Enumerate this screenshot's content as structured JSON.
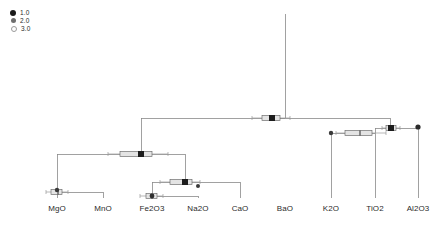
{
  "legend": {
    "name": "size-legend",
    "items": [
      {
        "label": "1.0",
        "marker": "filled-circle",
        "color": "#1a1a1a",
        "size": 6
      },
      {
        "label": "2.0",
        "marker": "medium-circle",
        "color": "#6e6e6e",
        "size": 5
      },
      {
        "label": "3.0",
        "marker": "open-circle",
        "color": "#b4b4b4",
        "size": 4
      }
    ]
  },
  "axis": {
    "leaf_labels": [
      "MgO",
      "MnO",
      "Fe2O3",
      "Na2O",
      "CaO",
      "BaO",
      "K2O",
      "TiO2",
      "Al2O3"
    ]
  },
  "chart_data": {
    "type": "tree",
    "title": "",
    "xlabel": "",
    "ylabel": "",
    "grid": false,
    "legend_position": "top-left",
    "leaves": [
      {
        "label": "MgO",
        "x": 57
      },
      {
        "label": "MnO",
        "x": 103
      },
      {
        "label": "Fe2O3",
        "x": 152
      },
      {
        "label": "Na2O",
        "x": 198
      },
      {
        "label": "CaO",
        "x": 240
      },
      {
        "label": "BaO",
        "x": 285
      },
      {
        "label": "K2O",
        "x": 331
      },
      {
        "label": "TiO2",
        "x": 375
      },
      {
        "label": "Al2O3",
        "x": 418
      }
    ],
    "nodes": [
      {
        "id": "n1",
        "children": [
          "MgO",
          "MnO"
        ],
        "x": 57,
        "y": 192,
        "box": {
          "q1": 51,
          "med": 58,
          "q3": 62,
          "lo": 46,
          "hi": 68
        }
      },
      {
        "id": "n2",
        "children": [
          "Fe2O3",
          "Na2O"
        ],
        "x": 152,
        "y": 196,
        "box": {
          "q1": 146,
          "med": 152,
          "q3": 157,
          "lo": 140,
          "hi": 163
        }
      },
      {
        "id": "n3",
        "children": [
          "n2",
          "CaO"
        ],
        "x": 185,
        "y": 182,
        "box": {
          "q1": 170,
          "med": 185,
          "q3": 192,
          "lo": 160,
          "hi": 200
        }
      },
      {
        "id": "n4",
        "children": [
          "n1",
          "n3"
        ],
        "x": 141,
        "y": 154,
        "box": {
          "q1": 120,
          "med": 141,
          "q3": 152,
          "lo": 108,
          "hi": 168
        }
      },
      {
        "id": "n5",
        "children": [
          "K2O",
          "TiO2"
        ],
        "x": 375,
        "y": 133,
        "box": {
          "q1": 345,
          "med": 360,
          "q3": 372,
          "lo": 336,
          "hi": 386
        }
      },
      {
        "id": "n6",
        "children": [
          "n5",
          "Al2O3"
        ],
        "x": 390,
        "y": 128,
        "box": {
          "q1": 386,
          "med": 391,
          "q3": 396,
          "lo": 382,
          "hi": 400
        }
      },
      {
        "id": "n7",
        "children": [
          "n4",
          "n6"
        ],
        "x": 270,
        "y": 118,
        "box": {
          "q1": 262,
          "med": 272,
          "q3": 280,
          "lo": 252,
          "hi": 290
        }
      }
    ],
    "root": {
      "x": 285,
      "y_top": 14,
      "y_base": 118
    },
    "merge_heights": [
      192,
      196,
      182,
      154,
      133,
      128,
      118
    ]
  }
}
